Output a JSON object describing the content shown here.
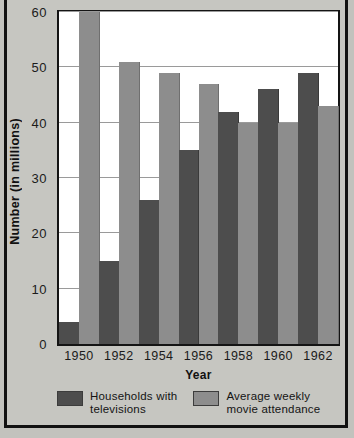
{
  "chart_data": {
    "type": "bar",
    "title": "",
    "xlabel": "Year",
    "ylabel": "Number (in millions)",
    "categories": [
      "1950",
      "1952",
      "1954",
      "1956",
      "1958",
      "1960",
      "1962"
    ],
    "series": [
      {
        "name": "Households with televisions",
        "color": "#4d4d4d",
        "values": [
          4,
          15,
          26,
          35,
          42,
          46,
          49
        ]
      },
      {
        "name": "Average weekly movie attendance",
        "color": "#8d8d8d",
        "values": [
          60,
          51,
          49,
          47,
          40,
          40,
          43
        ]
      }
    ],
    "ylim": [
      0,
      60
    ],
    "ytick_values": [
      0,
      10,
      20,
      30,
      40,
      50,
      60
    ],
    "ytick_labels": [
      "0",
      "10",
      "20",
      "30",
      "40",
      "50",
      "60"
    ],
    "grid": true,
    "legend_position": "bottom"
  },
  "legend": {
    "entries": [
      {
        "label": "Households with\ntelevisions",
        "swatch": "tv"
      },
      {
        "label": "Average weekly\nmovie attendance",
        "swatch": "movie"
      }
    ]
  },
  "axes": {
    "x_title": "Year",
    "y_title": "Number (in millions)"
  },
  "colors": {
    "background": "#c6c6c1",
    "plot_background": "#ffffff",
    "series_tv": "#4d4d4d",
    "series_movie": "#8d8d8d",
    "gridline": "#9a9a9a",
    "frame": "#111111"
  }
}
